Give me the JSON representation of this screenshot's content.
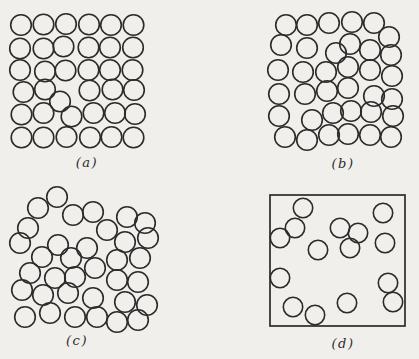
{
  "figure": {
    "ink_color": "#2b2b2b",
    "background_color": "#f1efec"
  },
  "panels": [
    {
      "id": "a",
      "label": "(a)",
      "circle_radius": 10.3,
      "circles": [
        [
          21,
          25
        ],
        [
          43.5,
          24.5
        ],
        [
          66,
          24
        ],
        [
          89,
          24.5
        ],
        [
          111,
          25
        ],
        [
          133.5,
          25
        ],
        [
          20,
          48.5
        ],
        [
          43.5,
          48.5
        ],
        [
          63.5,
          46.5
        ],
        [
          88.5,
          47.5
        ],
        [
          110,
          47.5
        ],
        [
          133,
          47.5
        ],
        [
          20,
          70
        ],
        [
          45,
          71.5
        ],
        [
          65.5,
          70.5
        ],
        [
          88.5,
          70
        ],
        [
          110,
          70
        ],
        [
          132.5,
          70
        ],
        [
          23.5,
          92
        ],
        [
          45,
          89.5
        ],
        [
          89.5,
          90.5
        ],
        [
          112.5,
          89.5
        ],
        [
          134,
          90
        ],
        [
          60,
          101.5
        ],
        [
          21.5,
          114.5
        ],
        [
          43.5,
          113
        ],
        [
          71.5,
          116.5
        ],
        [
          93.5,
          113
        ],
        [
          115,
          113
        ],
        [
          135,
          114
        ],
        [
          21.5,
          137.5
        ],
        [
          43.5,
          137.5
        ],
        [
          66.5,
          137
        ],
        [
          90,
          137.5
        ],
        [
          111.5,
          137
        ],
        [
          133.5,
          137.5
        ]
      ]
    },
    {
      "id": "b",
      "label": "(b)",
      "circle_radius": 10.3,
      "circles": [
        [
          286,
          25
        ],
        [
          307,
          25
        ],
        [
          329,
          23
        ],
        [
          352,
          22
        ],
        [
          374,
          23
        ],
        [
          389,
          37
        ],
        [
          281,
          45
        ],
        [
          307,
          48
        ],
        [
          336,
          53
        ],
        [
          350,
          44
        ],
        [
          370,
          50
        ],
        [
          391,
          55
        ],
        [
          278,
          70
        ],
        [
          303,
          72
        ],
        [
          326,
          72
        ],
        [
          348,
          67
        ],
        [
          370,
          70
        ],
        [
          392,
          76
        ],
        [
          279,
          94
        ],
        [
          305,
          94
        ],
        [
          327,
          91
        ],
        [
          348,
          88
        ],
        [
          374,
          96
        ],
        [
          392,
          99
        ],
        [
          279,
          116
        ],
        [
          312,
          120
        ],
        [
          333,
          113
        ],
        [
          351,
          111
        ],
        [
          371,
          112
        ],
        [
          393,
          116
        ],
        [
          285,
          137
        ],
        [
          307,
          140
        ],
        [
          329,
          135
        ],
        [
          348,
          134
        ],
        [
          370,
          135
        ],
        [
          391,
          137
        ]
      ]
    },
    {
      "id": "c",
      "label": "(c)",
      "circle_radius": 10.3,
      "circles": [
        [
          57,
          197
        ],
        [
          38,
          208
        ],
        [
          73,
          215
        ],
        [
          93,
          212
        ],
        [
          127,
          217
        ],
        [
          28,
          228
        ],
        [
          107,
          230
        ],
        [
          145,
          223
        ],
        [
          20,
          243
        ],
        [
          58,
          245
        ],
        [
          87,
          248
        ],
        [
          125,
          242
        ],
        [
          148,
          238
        ],
        [
          42,
          257
        ],
        [
          71,
          258
        ],
        [
          117,
          260
        ],
        [
          140,
          258
        ],
        [
          30,
          273
        ],
        [
          55,
          278
        ],
        [
          75,
          277
        ],
        [
          95,
          268
        ],
        [
          117,
          280
        ],
        [
          138,
          282
        ],
        [
          22,
          290
        ],
        [
          43,
          295
        ],
        [
          68,
          293
        ],
        [
          93,
          298
        ],
        [
          125,
          302
        ],
        [
          147,
          305
        ],
        [
          25,
          317
        ],
        [
          50,
          313
        ],
        [
          75,
          317
        ],
        [
          97,
          317
        ],
        [
          117,
          322
        ],
        [
          138,
          320
        ]
      ]
    },
    {
      "id": "d",
      "label": "(d)",
      "circle_radius": 9.7,
      "box": {
        "x": 270,
        "y": 195,
        "width": 135,
        "height": 131
      },
      "circles": [
        [
          303,
          208
        ],
        [
          383,
          213
        ],
        [
          295,
          228
        ],
        [
          340,
          228
        ],
        [
          358,
          233
        ],
        [
          280,
          238
        ],
        [
          318,
          250
        ],
        [
          350,
          248
        ],
        [
          385,
          243
        ],
        [
          280,
          278
        ],
        [
          388,
          283
        ],
        [
          293,
          307
        ],
        [
          315,
          315
        ],
        [
          347,
          303
        ],
        [
          393,
          302
        ]
      ]
    }
  ]
}
